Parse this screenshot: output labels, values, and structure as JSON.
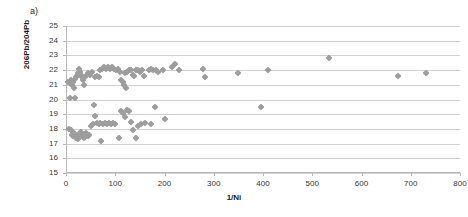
{
  "panel": {
    "label": "a)"
  },
  "chart_data": {
    "type": "scatter",
    "title": "",
    "subtitle": "",
    "xlabel": "1/Ni",
    "ylabel": "206Pb/204Pb",
    "xlim": [
      0,
      800
    ],
    "ylim": [
      15,
      25
    ],
    "xticks": [
      0,
      100,
      200,
      300,
      400,
      500,
      600,
      700,
      800
    ],
    "yticks": [
      15,
      16,
      17,
      18,
      19,
      20,
      21,
      22,
      23,
      24,
      25
    ],
    "grid": "horizontal",
    "legend": "none",
    "marker": {
      "shape": "diamond",
      "color": "#9d9d9d",
      "size": 5
    },
    "series": [
      {
        "name": "206Pb/204Pb vs 1/Ni",
        "points": [
          [
            5,
            21.2
          ],
          [
            8,
            21.1
          ],
          [
            10,
            21.3
          ],
          [
            12,
            21.0
          ],
          [
            14,
            21.2
          ],
          [
            16,
            20.8
          ],
          [
            18,
            21.4
          ],
          [
            20,
            21.5
          ],
          [
            22,
            21.6
          ],
          [
            24,
            21.8
          ],
          [
            26,
            22.1
          ],
          [
            28,
            21.9
          ],
          [
            30,
            21.7
          ],
          [
            32,
            21.5
          ],
          [
            34,
            21.3
          ],
          [
            36,
            21.0
          ],
          [
            40,
            21.6
          ],
          [
            44,
            21.8
          ],
          [
            48,
            21.7
          ],
          [
            52,
            21.9
          ],
          [
            58,
            21.5
          ],
          [
            62,
            21.6
          ],
          [
            66,
            21.5
          ],
          [
            70,
            22.0
          ],
          [
            74,
            22.1
          ],
          [
            78,
            22.2
          ],
          [
            82,
            22.1
          ],
          [
            86,
            22.2
          ],
          [
            90,
            22.1
          ],
          [
            94,
            22.2
          ],
          [
            98,
            22.1
          ],
          [
            102,
            22.0
          ],
          [
            106,
            22.1
          ],
          [
            110,
            21.9
          ],
          [
            112,
            21.3
          ],
          [
            116,
            21.2
          ],
          [
            120,
            21.8
          ],
          [
            124,
            21.9
          ],
          [
            128,
            22.0
          ],
          [
            132,
            22.0
          ],
          [
            136,
            21.7
          ],
          [
            138,
            21.6
          ],
          [
            142,
            22.0
          ],
          [
            146,
            22.0
          ],
          [
            150,
            21.9
          ],
          [
            154,
            22.0
          ],
          [
            158,
            21.6
          ],
          [
            168,
            22.0
          ],
          [
            172,
            22.1
          ],
          [
            176,
            22.0
          ],
          [
            182,
            22.0
          ],
          [
            186,
            21.9
          ],
          [
            196,
            22.0
          ],
          [
            215,
            22.2
          ],
          [
            222,
            22.4
          ],
          [
            230,
            22.0
          ],
          [
            278,
            22.1
          ],
          [
            282,
            21.5
          ],
          [
            350,
            21.8
          ],
          [
            122,
            20.8
          ],
          [
            118,
            21.0
          ],
          [
            8,
            20.1
          ],
          [
            18,
            20.1
          ],
          [
            6,
            18.0
          ],
          [
            10,
            17.9
          ],
          [
            12,
            17.6
          ],
          [
            14,
            17.5
          ],
          [
            16,
            17.7
          ],
          [
            18,
            17.6
          ],
          [
            20,
            17.4
          ],
          [
            22,
            17.5
          ],
          [
            24,
            17.3
          ],
          [
            26,
            17.6
          ],
          [
            28,
            17.7
          ],
          [
            30,
            17.8
          ],
          [
            32,
            17.5
          ],
          [
            34,
            17.6
          ],
          [
            36,
            17.4
          ],
          [
            38,
            17.6
          ],
          [
            40,
            17.7
          ],
          [
            44,
            17.5
          ],
          [
            46,
            17.6
          ],
          [
            50,
            18.2
          ],
          [
            54,
            18.3
          ],
          [
            56,
            19.6
          ],
          [
            58,
            18.9
          ],
          [
            62,
            18.4
          ],
          [
            66,
            18.3
          ],
          [
            70,
            18.4
          ],
          [
            72,
            17.2
          ],
          [
            76,
            18.3
          ],
          [
            80,
            18.4
          ],
          [
            84,
            18.3
          ],
          [
            88,
            18.4
          ],
          [
            92,
            18.3
          ],
          [
            96,
            18.4
          ],
          [
            100,
            18.3
          ],
          [
            108,
            17.4
          ],
          [
            112,
            19.2
          ],
          [
            116,
            19.1
          ],
          [
            120,
            18.8
          ],
          [
            124,
            19.3
          ],
          [
            128,
            19.2
          ],
          [
            132,
            18.5
          ],
          [
            136,
            17.9
          ],
          [
            142,
            17.4
          ],
          [
            146,
            18.2
          ],
          [
            152,
            18.3
          ],
          [
            160,
            18.4
          ],
          [
            172,
            18.3
          ],
          [
            180,
            19.5
          ],
          [
            200,
            18.7
          ],
          [
            395,
            19.5
          ],
          [
            410,
            22.0
          ],
          [
            535,
            22.8
          ],
          [
            675,
            21.6
          ],
          [
            730,
            21.8
          ]
        ]
      }
    ]
  }
}
